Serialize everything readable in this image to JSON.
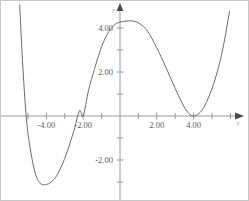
{
  "chart_data": {
    "type": "line",
    "title": "",
    "xlabel": "x",
    "ylabel": "y",
    "xlim": [
      -5.45,
      5.95
    ],
    "ylim": [
      -5.2,
      3.95
    ],
    "grid": false,
    "legend": null,
    "axis_origin_px": [
      119,
      115
    ],
    "px_per_unit_x": 18.4,
    "px_per_unit_y": 22.0,
    "x_tick_labels": [
      "-4.00",
      "-2.00",
      "2.00",
      "4.00"
    ],
    "x_tick_values": [
      -4,
      -2,
      2,
      4
    ],
    "y_tick_labels": [
      "4.00",
      "2.00",
      "-2.00"
    ],
    "y_tick_values": [
      4,
      2,
      -2
    ],
    "minor_tick_step": 1,
    "roots": [
      -5.1,
      -2,
      4
    ],
    "double_root": 4,
    "local_max": {
      "x": 0.7,
      "y": 4.3
    },
    "local_min_left": {
      "x": -3.6,
      "y": -3.1
    },
    "local_min_right": {
      "x": 4.0,
      "y": 0.0
    },
    "y_intercept": 4.05,
    "series": [
      {
        "name": "quartic",
        "expression": "0.05(x+5.1)(x+2)(x-4)^2",
        "x": [
          -5.45,
          -5.3,
          -5.1,
          -4.9,
          -4.6,
          -4.3,
          -4.0,
          -3.8,
          -3.6,
          -3.4,
          -3.1,
          -2.8,
          -2.5,
          -2.2,
          -2.0,
          -1.7,
          -1.4,
          -1.0,
          -0.6,
          -0.2,
          0.2,
          0.7,
          1.1,
          1.5,
          2.0,
          2.5,
          3.0,
          3.4,
          3.7,
          4.0,
          4.3,
          4.6,
          5.0,
          5.3,
          5.6,
          5.95
        ],
        "y": [
          5.05,
          2.52,
          0.0,
          -1.37,
          -2.63,
          -3.08,
          -3.11,
          -3.04,
          -2.89,
          -2.65,
          -2.13,
          -1.45,
          -0.65,
          0.24,
          0.0,
          1.2,
          2.1,
          3.15,
          3.85,
          4.2,
          4.3,
          4.32,
          4.18,
          3.85,
          3.1,
          2.2,
          1.25,
          0.55,
          0.15,
          0.0,
          0.12,
          0.45,
          1.25,
          2.05,
          3.1,
          4.75
        ]
      }
    ]
  },
  "labels": {
    "x_axis_name": "x",
    "y_axis_name": "y",
    "x_tick_neg4": "-4.00",
    "x_tick_neg2": "-2.00",
    "x_tick_pos2": "2.00",
    "x_tick_pos4": "4.00",
    "y_tick_pos4": "4.00",
    "y_tick_pos2": "2.00",
    "y_tick_neg2": "-2.00"
  },
  "colors": {
    "curve": "#6b6b6b",
    "axis": "#9a9a9a",
    "label": "#5a5a5a",
    "background": "#ffffff",
    "border": "#c8c8c8"
  }
}
